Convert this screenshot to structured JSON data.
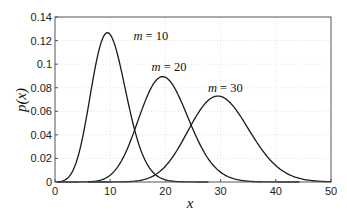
{
  "chart_data": {
    "type": "line",
    "title": "",
    "xlabel": "x",
    "ylabel": "p(x)",
    "xlim": [
      0,
      50
    ],
    "ylim": [
      0,
      0.14
    ],
    "xticks": [
      0,
      10,
      20,
      30,
      40,
      50
    ],
    "xtick_labels": [
      "0",
      "10",
      "20",
      "30",
      "40",
      "50"
    ],
    "yticks": [
      0,
      0.02,
      0.04,
      0.06,
      0.08,
      0.1,
      0.12,
      0.14
    ],
    "ytick_labels": [
      "0",
      "0.02",
      "0.04",
      "0.06",
      "0.08",
      "0.1",
      "0.12",
      "0.14"
    ],
    "grid": true,
    "legend": "none (inline annotations)",
    "distribution": "Poisson",
    "series": [
      {
        "name": "m = 10",
        "m": 10,
        "label_var": "m",
        "label_value": "10",
        "peak_x": 9.5,
        "peak_y": 0.125,
        "x": [
          0,
          2,
          4,
          6,
          8,
          10,
          12,
          14,
          16,
          18,
          20,
          22,
          24
        ],
        "values": [
          0.0,
          0.0023,
          0.0189,
          0.0631,
          0.1126,
          0.1251,
          0.0948,
          0.0521,
          0.0217,
          0.0071,
          0.0019,
          0.0004,
          0.0001
        ]
      },
      {
        "name": "m = 20",
        "m": 20,
        "label_var": "m",
        "label_value": "20",
        "peak_x": 19.5,
        "peak_y": 0.089,
        "x": [
          6,
          8,
          10,
          12,
          14,
          16,
          18,
          20,
          22,
          24,
          26,
          28,
          30,
          32,
          34,
          36
        ],
        "values": [
          0.0001,
          0.0013,
          0.0058,
          0.0176,
          0.0387,
          0.0646,
          0.0844,
          0.0888,
          0.0769,
          0.0557,
          0.0341,
          0.0181,
          0.0083,
          0.0034,
          0.0012,
          0.0004
        ]
      },
      {
        "name": "m = 30",
        "m": 30,
        "label_var": "m",
        "label_value": "30",
        "peak_x": 29.5,
        "peak_y": 0.0726,
        "x": [
          14,
          16,
          18,
          20,
          22,
          24,
          26,
          28,
          30,
          32,
          34,
          36,
          38,
          40,
          42,
          44,
          46,
          48,
          50
        ],
        "values": [
          0.0001,
          0.0004,
          0.0024,
          0.0083,
          0.0212,
          0.0363,
          0.0558,
          0.0692,
          0.0726,
          0.0659,
          0.0533,
          0.0375,
          0.0237,
          0.0139,
          0.0072,
          0.0033,
          0.0014,
          0.0005,
          0.0002
        ]
      }
    ],
    "annotations": [
      {
        "text": "m = 10",
        "x": 14.2,
        "y": 0.124
      },
      {
        "text": "m = 20",
        "x": 17.5,
        "y": 0.098
      },
      {
        "text": "m = 30",
        "x": 27.7,
        "y": 0.08
      }
    ]
  }
}
